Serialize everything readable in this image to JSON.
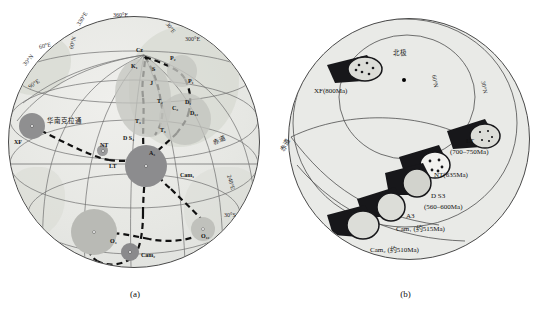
{
  "figure": {
    "panel_a_caption": "(a)",
    "panel_b_caption": "(b)"
  },
  "panel_a": {
    "name": "apparent-polar-wander-path-globe",
    "region_label": "华南克拉通",
    "equator_label": "赤道",
    "longitude_labels": [
      {
        "text": "360°E",
        "x": 121,
        "y": 14,
        "rot": 0
      },
      {
        "text": "330°E",
        "x": 86,
        "y": 20,
        "rot": -52
      },
      {
        "text": "300°E",
        "x": 157,
        "y": 28,
        "rot": 0
      },
      {
        "text": "60°E",
        "x": 38,
        "y": 39,
        "rot": -16
      },
      {
        "text": "90°E",
        "x": 26,
        "y": 74,
        "rot": -38
      },
      {
        "text": "240°E",
        "x": 228,
        "y": 172,
        "rot": 72
      },
      {
        "text": "30°E",
        "x": 160,
        "y": 16,
        "rot": 55
      }
    ],
    "latitude_labels": [
      {
        "text": "60°N",
        "x": 66,
        "y": 51,
        "rot": -72
      },
      {
        "text": "30°N",
        "x": 22,
        "y": 57,
        "rot": -50
      },
      {
        "text": "30°S",
        "x": 222,
        "y": 214,
        "rot": 0
      }
    ],
    "poles": [
      {
        "id": "XF",
        "label": "XF",
        "x": 22,
        "y": 112,
        "r": 12,
        "tone": "#8f8f90",
        "lx": 14,
        "ly": 140
      },
      {
        "id": "NT",
        "label": "NT",
        "x": 105,
        "y": 151,
        "r": 5,
        "tone": "#9b9b9c",
        "lx": 101,
        "ly": 143
      },
      {
        "id": "LT",
        "label": "LT",
        "x": 110,
        "y": 160,
        "r": 4,
        "tone": "#9a9a9b",
        "lx": 111,
        "ly": 166
      },
      {
        "id": "DS3",
        "label": "D S₃",
        "x": 144,
        "y": 163,
        "r": 18,
        "tone": "#8c8c8e",
        "lx": 122,
        "ly": 138
      },
      {
        "id": "A3",
        "label": "A₃",
        "x": 150,
        "y": 160,
        "r": 0,
        "tone": "",
        "lx": 149,
        "ly": 153
      },
      {
        "id": "Cam1",
        "label": "Cam₁",
        "x": 178,
        "y": 172,
        "r": 0,
        "tone": "",
        "lx": 180,
        "ly": 176
      },
      {
        "id": "Cam2",
        "label": "Cam₂",
        "x": 131,
        "y": 250,
        "r": 8,
        "tone": "#8a8a8c",
        "lx": 142,
        "ly": 254
      },
      {
        "id": "O3",
        "label": "O₃",
        "x": 103,
        "y": 234,
        "r": 22,
        "tone": "#b6b7b2",
        "lx": 112,
        "ly": 242
      },
      {
        "id": "O12",
        "label": "O₁₂",
        "x": 207,
        "y": 228,
        "r": 11,
        "tone": "#bdbeb9",
        "lx": 204,
        "ly": 240
      },
      {
        "id": "Cz",
        "label": "Cz",
        "x": 143,
        "y": 53,
        "r": 0,
        "tone": "",
        "lx": 139,
        "ly": 48
      },
      {
        "id": "K1",
        "label": "K₁",
        "x": 141,
        "y": 64,
        "r": 0,
        "tone": "",
        "lx": 136,
        "ly": 62
      },
      {
        "id": "P2",
        "label": "P₂",
        "x": 174,
        "y": 61,
        "r": 0,
        "tone": "",
        "lx": 171,
        "ly": 57
      },
      {
        "id": "P1",
        "label": "P₁",
        "x": 190,
        "y": 80,
        "r": 0,
        "tone": "",
        "lx": 188,
        "ly": 77
      },
      {
        "id": "D1",
        "label": "D₁",
        "x": 184,
        "y": 105,
        "r": 0,
        "tone": "",
        "lx": 183,
        "ly": 102
      },
      {
        "id": "D12",
        "label": "D₁₂",
        "x": 190,
        "y": 115,
        "r": 0,
        "tone": "",
        "lx": 188,
        "ly": 112
      },
      {
        "id": "C3",
        "label": "C₃",
        "x": 175,
        "y": 112,
        "r": 0,
        "tone": "",
        "lx": 173,
        "ly": 109
      },
      {
        "id": "T3",
        "label": "T₃",
        "x": 141,
        "y": 121,
        "r": 0,
        "tone": "",
        "lx": 138,
        "ly": 119
      },
      {
        "id": "T1",
        "label": "T₁",
        "x": 163,
        "y": 129,
        "r": 0,
        "tone": "",
        "lx": 161,
        "ly": 127
      },
      {
        "id": "T2",
        "label": "T₂",
        "x": 160,
        "y": 103,
        "r": 0,
        "tone": "",
        "lx": 158,
        "ly": 100
      },
      {
        "id": "J",
        "label": "J",
        "x": 151,
        "y": 83,
        "r": 0,
        "tone": "",
        "lx": 150,
        "ly": 80
      },
      {
        "id": "S",
        "label": "S",
        "x": 153,
        "y": 71,
        "r": 0,
        "tone": "",
        "lx": 152,
        "ly": 68
      }
    ]
  },
  "panel_b": {
    "name": "paleolatitude-reconstruction-globe",
    "north_pole_label": "北极",
    "equator_label": "赤道",
    "latitude_labels": [
      {
        "text": "60°N",
        "x": 242,
        "y": 60,
        "rot": 78
      },
      {
        "text": "30°N",
        "x": 398,
        "y": 66,
        "rot": 76
      }
    ],
    "blocks": [
      {
        "id": "XF",
        "label": "XF(800Ma)",
        "x": 342,
        "y": 90
      },
      {
        "id": "LT",
        "label": "LT",
        "x": 466,
        "y": 140,
        "sub": "(700–750Ma)",
        "sx": 452,
        "sy": 150
      },
      {
        "id": "NT",
        "label": "NT(635Ma)",
        "x": 436,
        "y": 173
      },
      {
        "id": "DS3",
        "label": "D S3",
        "x": 434,
        "y": 192,
        "sub": "(560–600Ma)",
        "sx": 428,
        "sy": 202
      },
      {
        "id": "A3",
        "label": "A3",
        "x": 412,
        "y": 212
      },
      {
        "id": "Cam1",
        "label": "Cam₁  (约515Ma)",
        "x": 399,
        "y": 224
      },
      {
        "id": "Cam2",
        "label": "Cam₂   (约510Ma)",
        "x": 374,
        "y": 245
      }
    ]
  },
  "colors": {
    "globe_fill": "#e8e9e6",
    "land_fill": "#d7d9d2",
    "graticule": "#6d6d6d",
    "outline": "#3c3c3c",
    "path": "#111111",
    "block_dark": "#17171a",
    "block_light": "#d9dad4"
  }
}
